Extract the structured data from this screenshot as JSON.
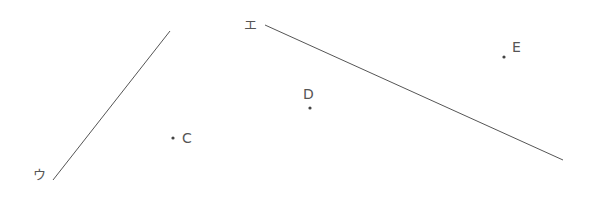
{
  "diagram": {
    "background": "#ffffff",
    "stroke_color": "#555555",
    "lines": [
      {
        "id": "line-u",
        "label": "ウ",
        "x1": 53,
        "y1": 180,
        "x2": 170,
        "y2": 31,
        "label_x": 33,
        "label_y": 179
      },
      {
        "id": "line-e",
        "label": "エ",
        "x1": 265,
        "y1": 25,
        "x2": 563,
        "y2": 160,
        "label_x": 244,
        "label_y": 29
      }
    ],
    "points": [
      {
        "id": "point-c",
        "label": "C",
        "x": 173,
        "y": 138,
        "label_x": 182,
        "label_y": 143
      },
      {
        "id": "point-d",
        "label": "D",
        "x": 310,
        "y": 108,
        "label_x": 303,
        "label_y": 99
      },
      {
        "id": "point-e",
        "label": "E",
        "x": 504,
        "y": 57,
        "label_x": 512,
        "label_y": 52
      }
    ]
  }
}
